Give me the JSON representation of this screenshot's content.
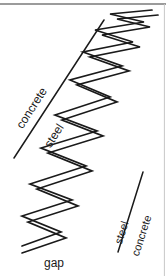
{
  "figure": {
    "width": 166,
    "height": 276,
    "background_color": "#ffffff",
    "ink_color": "#1a1a1a",
    "border": {
      "top_rule_color": "#7a7a7a",
      "right_rule_color": "#c8c8c8"
    },
    "labels": {
      "concrete_top": "concrete",
      "steel_top": "steel",
      "steel_bottom": "steel",
      "concrete_bottom": "concrete",
      "gap": "gap"
    },
    "interfaces": [
      {
        "name": "upper-left-interface",
        "x1": 14,
        "y1": 158,
        "x2": 104,
        "y2": 20,
        "upper_material": "concrete",
        "lower_material": "steel"
      },
      {
        "name": "lower-right-interface",
        "x1": 118,
        "y1": 252,
        "x2": 143,
        "y2": 172,
        "left_material": "steel",
        "right_material": "concrete"
      }
    ],
    "crack": {
      "description": "zigzag crack gap between steel and concrete",
      "upper_polyline": "22,246 61,232 22,216 72,200 30,184 86,166 41,148 97,131 55,115 110,97 70,80 122,66 83,52 133,42 95,30 144,22 110,14 152,10",
      "lower_polyline": "22,253 66,238 28,222 78,206 37,189 92,171 48,153 103,136 62,120 117,102 77,85 129,71 90,57 140,47 102,35 150,27 117,19 158,15"
    }
  }
}
